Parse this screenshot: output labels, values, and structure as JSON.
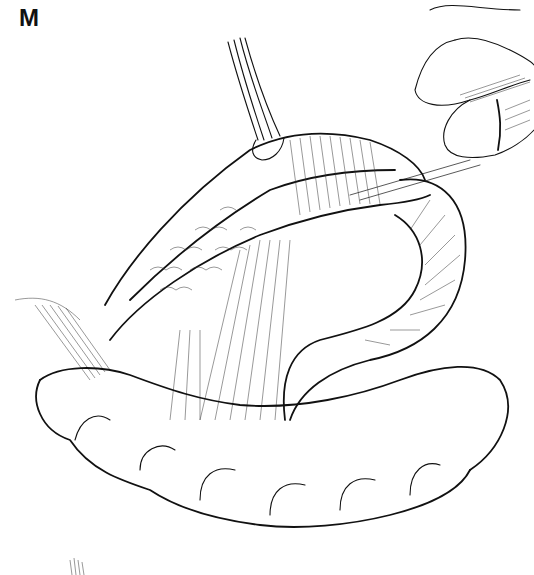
{
  "figure": {
    "panel_label": "M",
    "elements": [
      {
        "name": "forceps",
        "description": "Forceps holding bowel wall at top center"
      },
      {
        "name": "fingers",
        "description": "Surgeon's fingers holding suture thread at top right"
      },
      {
        "name": "suture-thread",
        "description": "Thread extending from bowel to fingers"
      },
      {
        "name": "bowel-segment-anastomosis",
        "description": "Diagonal bowel segment with suture line (mucosal pattern)"
      },
      {
        "name": "small-bowel-loop",
        "description": "Curved loop of small intestine on right"
      },
      {
        "name": "mesentery",
        "description": "Fan-shaped mesentery in center"
      },
      {
        "name": "colon",
        "description": "Haustrated colon at bottom"
      }
    ],
    "colors": {
      "ink": "#111111",
      "background": "#ffffff"
    }
  }
}
